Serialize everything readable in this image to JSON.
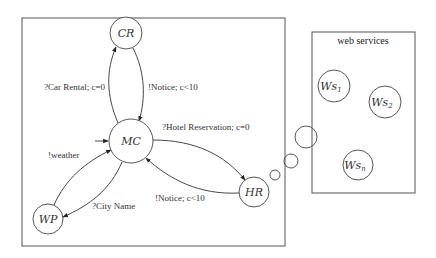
{
  "diagram": {
    "main_box": {
      "x": 22,
      "y": 18,
      "width": 263,
      "height": 228
    },
    "web_services_box": {
      "x": 312,
      "y": 32,
      "width": 103,
      "height": 161,
      "title": "web services"
    },
    "nodes": [
      {
        "id": "CR",
        "label": "CR",
        "cx": 126,
        "cy": 33,
        "r": 16
      },
      {
        "id": "MC",
        "label": "MC",
        "cx": 131,
        "cy": 141,
        "r": 22,
        "initial": true
      },
      {
        "id": "WP",
        "label": "WP",
        "cx": 48,
        "cy": 219,
        "r": 15
      },
      {
        "id": "HR",
        "label": "HR",
        "cx": 254,
        "cy": 192,
        "r": 15
      }
    ],
    "services": [
      {
        "id": "Ws1",
        "label": "Ws",
        "sub": "1",
        "cx": 334,
        "cy": 86,
        "r": 16
      },
      {
        "id": "Ws2",
        "label": "Ws",
        "sub": "2",
        "cx": 385,
        "cy": 102,
        "r": 16
      },
      {
        "id": "Wsn",
        "label": "Ws",
        "sub": "n",
        "cx": 358,
        "cy": 165,
        "r": 15
      }
    ],
    "edges": [
      {
        "from": "MC",
        "to": "CR",
        "label": "?Car Rental; c=0"
      },
      {
        "from": "CR",
        "to": "MC",
        "label": "!Notice; c<10"
      },
      {
        "from": "MC",
        "to": "HR",
        "label": "?Hotel Reservation; c=0"
      },
      {
        "from": "HR",
        "to": "MC",
        "label": "!Notice; c<10"
      },
      {
        "from": "WP",
        "to": "MC",
        "label": "!weather"
      },
      {
        "from": "MC",
        "to": "WP",
        "label": "?City Name"
      }
    ],
    "thought_bubbles": [
      {
        "cx": 275,
        "cy": 175,
        "r": 5
      },
      {
        "cx": 291,
        "cy": 161,
        "r": 7
      },
      {
        "cx": 306,
        "cy": 137,
        "r": 11
      }
    ]
  }
}
